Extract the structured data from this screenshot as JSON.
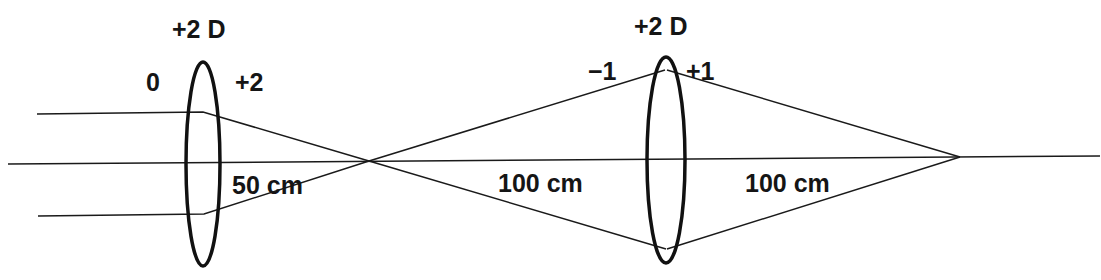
{
  "diagram": {
    "type": "optics-ray-diagram",
    "colors": {
      "stroke": "#1a1a1a",
      "text": "#151515",
      "background": "#ffffff"
    },
    "lenses": [
      {
        "id": "lens-1",
        "power_label": "+2 D",
        "vergence_in": "0",
        "vergence_out": "+2",
        "center_x": 203,
        "top_y": 62,
        "bottom_y": 266,
        "half_width": 17
      },
      {
        "id": "lens-2",
        "power_label": "+2 D",
        "vergence_in": "−1",
        "vergence_out": "+1",
        "center_x": 666,
        "top_y": 57,
        "bottom_y": 263,
        "half_width": 19
      }
    ],
    "distances": [
      {
        "label": "50 cm",
        "x": 232,
        "y": 193
      },
      {
        "label": "100 cm",
        "x": 498,
        "y": 191
      },
      {
        "label": "100 cm",
        "x": 745,
        "y": 191
      }
    ],
    "focal_points": [
      {
        "x": 369,
        "y": 161
      },
      {
        "x": 960,
        "y": 157
      }
    ]
  }
}
